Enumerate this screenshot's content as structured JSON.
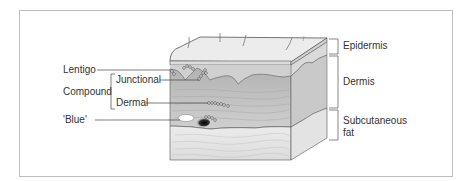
{
  "diagram": {
    "left_labels": {
      "lentigo": "Lentigo",
      "compound": "Compound",
      "junctional": "Junctional",
      "dermal": "Dermal",
      "blue": "'Blue'"
    },
    "right_labels": {
      "epidermis": "Epidermis",
      "dermis": "Dermis",
      "subcutaneous_line1": "Subcutaneous",
      "subcutaneous_line2": "fat"
    },
    "colors": {
      "frame": "#bdbdbd",
      "epidermis_top": "#e9e9e9",
      "dermis": "#c8c8c8",
      "dermis_upper": "#b9b9b9",
      "fat": "#e2e2e2",
      "side_face": "#d8d8d8",
      "lines": "#555555",
      "text": "#333333"
    }
  }
}
